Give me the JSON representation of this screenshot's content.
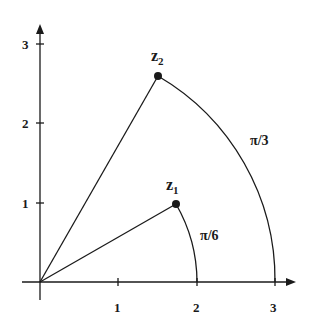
{
  "diagram": {
    "type": "complex-plane-polar",
    "colors": {
      "ink": "#1a1a1a",
      "background": "#ffffff"
    },
    "axes": {
      "x_ticks": [
        "1",
        "2",
        "3"
      ],
      "y_ticks": [
        "1",
        "2",
        "3"
      ]
    },
    "points": [
      {
        "name": "z",
        "subscript": "1",
        "modulus": 2,
        "argument": "π/6"
      },
      {
        "name": "z",
        "subscript": "2",
        "modulus": 3,
        "argument": "π/3"
      }
    ],
    "arc_labels": [
      "π/6",
      "π/3"
    ]
  }
}
